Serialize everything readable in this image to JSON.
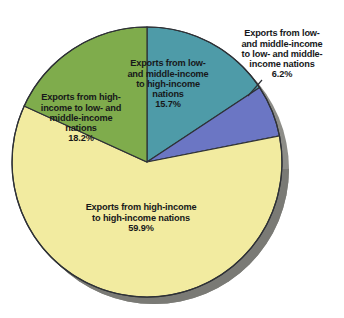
{
  "chart_data": {
    "type": "pie",
    "title": "",
    "subtitle": "",
    "xlabel": "",
    "ylabel": "",
    "legend_position": "none",
    "grid": false,
    "units": "percent",
    "total": 100.0,
    "categories": [
      "Exports from low- and middle-income to high-income nations",
      "Exports from low- and middle-income to low- and middle-income nations",
      "Exports from high-income to high-income nations",
      "Exports from high-income to low- and middle-income nations"
    ],
    "values": [
      15.7,
      6.2,
      59.9,
      18.2
    ],
    "slices": [
      {
        "key": "lmi-to-high",
        "label": "Exports from low-\nand middle-income\nto high-income\nnations",
        "value_label": "15.7%",
        "value": 15.7,
        "color": "#4E9BA8",
        "label_placement": "inside"
      },
      {
        "key": "lmi-to-lmi",
        "label": "Exports from low-\nand middle-income\nto low- and middle-\nincome nations",
        "value_label": "6.2%",
        "value": 6.2,
        "color": "#6B76C4",
        "label_placement": "outside-callout"
      },
      {
        "key": "high-to-high",
        "label": "Exports from high-income\nto high-income nations",
        "value_label": "59.9%",
        "value": 59.9,
        "color": "#F2EBA0",
        "label_placement": "inside"
      },
      {
        "key": "high-to-lmi",
        "label": "Exports from high-\nincome to low- and\nmiddle-income\nnations",
        "value_label": "18.2%",
        "value": 18.2,
        "color": "#7FAC4C",
        "label_placement": "inside"
      }
    ],
    "style": {
      "background": "#FFFFFF",
      "slice_outline": "#2E3136",
      "depth_shadow": "#8D8D88",
      "depth_shadow_dark": "#6E6E6A",
      "label_text": "#17181A",
      "callout_line": "#2E3136"
    }
  }
}
